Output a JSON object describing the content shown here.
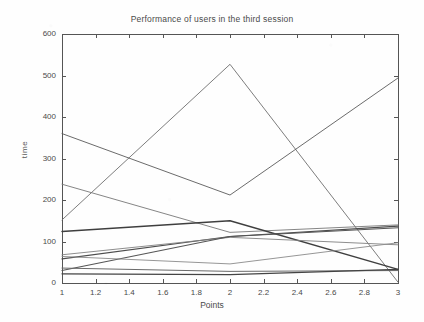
{
  "chart_data": {
    "type": "line",
    "title": "Performance of users in the third session",
    "xlabel": "Points",
    "ylabel": "time",
    "x": [
      1,
      2,
      3
    ],
    "xlim": [
      1,
      3
    ],
    "ylim": [
      0,
      600
    ],
    "xticks": [
      "1",
      "1.2",
      "1.4",
      "1.6",
      "1.8",
      "2",
      "2.2",
      "2.4",
      "2.6",
      "2.8",
      "3"
    ],
    "xtick_values": [
      1,
      1.2,
      1.4,
      1.6,
      1.8,
      2,
      2.2,
      2.4,
      2.6,
      2.8,
      3
    ],
    "yticks": [
      "0",
      "100",
      "200",
      "300",
      "400",
      "500",
      "600"
    ],
    "ytick_values": [
      0,
      100,
      200,
      300,
      400,
      500,
      600
    ],
    "grid": false,
    "legend": "none",
    "series": [
      {
        "name": "user-1",
        "values": [
          152,
          527,
          2
        ],
        "color": "#6e6e6e",
        "width": 0.9
      },
      {
        "name": "user-2",
        "values": [
          360,
          212,
          494
        ],
        "color": "#5a5a5a",
        "width": 0.9
      },
      {
        "name": "user-3",
        "values": [
          238,
          122,
          140
        ],
        "color": "#777777",
        "width": 0.9
      },
      {
        "name": "user-4",
        "values": [
          124,
          150,
          33
        ],
        "color": "#3f3f3f",
        "width": 1.4
      },
      {
        "name": "user-5",
        "values": [
          58,
          112,
          137
        ],
        "color": "#4d4d4d",
        "width": 1.2
      },
      {
        "name": "user-6",
        "values": [
          68,
          110,
          92
        ],
        "color": "#808080",
        "width": 0.9
      },
      {
        "name": "user-7",
        "values": [
          30,
          112,
          133
        ],
        "color": "#555555",
        "width": 1.1
      },
      {
        "name": "user-8",
        "values": [
          64,
          46,
          97
        ],
        "color": "#8a8a8a",
        "width": 0.9
      },
      {
        "name": "user-9",
        "values": [
          36,
          28,
          30
        ],
        "color": "#6a6a6a",
        "width": 1.0
      },
      {
        "name": "user-10",
        "values": [
          22,
          20,
          33
        ],
        "color": "#444444",
        "width": 1.3
      }
    ]
  },
  "axes": {
    "plot_left_px": 62,
    "plot_right_px": 398,
    "plot_top_px": 34,
    "plot_bottom_px": 283
  }
}
